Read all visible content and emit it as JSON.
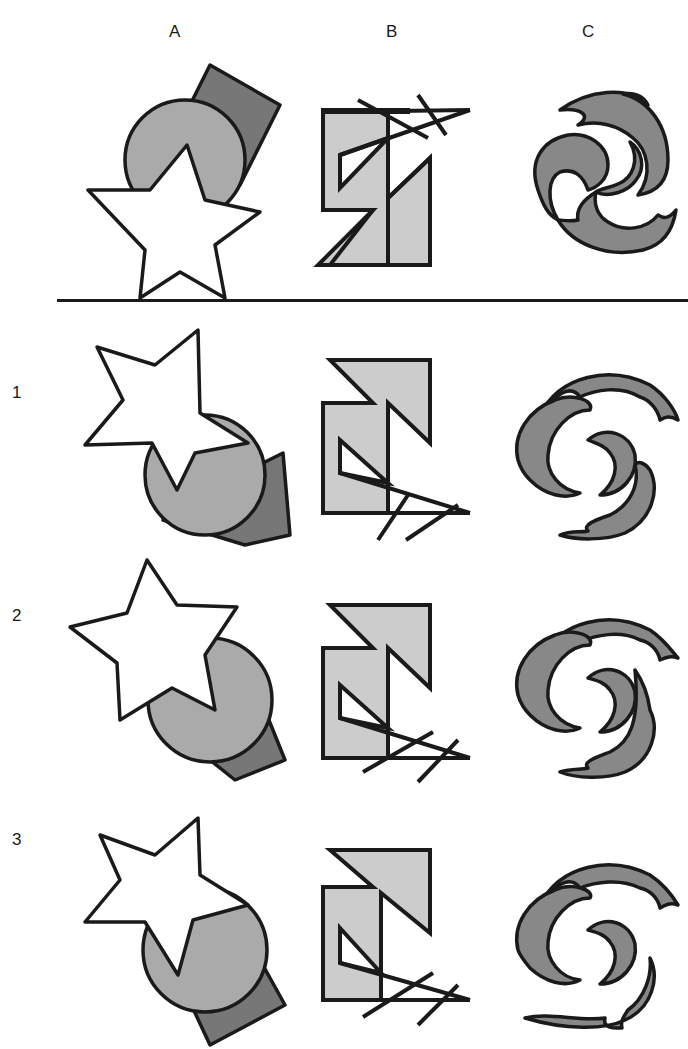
{
  "columns": [
    {
      "label": "A",
      "x": 169
    },
    {
      "label": "B",
      "x": 386
    },
    {
      "label": "C",
      "x": 582
    }
  ],
  "rows": [
    {
      "label": "",
      "role": "reference",
      "y_offset": 0
    },
    {
      "label": "1",
      "role": "option",
      "y_offset": 260
    },
    {
      "label": "2",
      "role": "option",
      "y_offset": 510
    },
    {
      "label": "3",
      "role": "option",
      "y_offset": 760
    }
  ],
  "row_labels": [
    "1",
    "2",
    "3"
  ],
  "colors": {
    "outline": "#1a1a1a",
    "square_fill": "#777777",
    "circle_fill": "#aaaaaa",
    "star_fill": "#ffffff",
    "zshape_fill": "#cccccc",
    "swirl_fill": "#888888",
    "background": "#ffffff"
  },
  "figures": {
    "A": "star-circle-square",
    "B": "z-shape-with-crossed-lines",
    "C": "three-arm-swirl"
  }
}
